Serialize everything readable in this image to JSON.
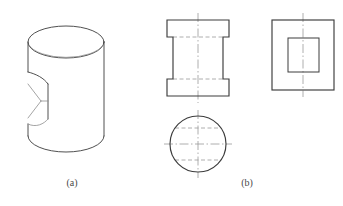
{
  "figure": {
    "kind": "engineering-orthographic-drawing",
    "background_color": "#ffffff",
    "line_color": "#3c3c3c",
    "hidden_line_color": "#9a9a9a",
    "center_line_color": "#9a9a9a",
    "captions": [
      {
        "id": "a",
        "label": "(a)",
        "x": 72,
        "y": 186
      },
      {
        "id": "b",
        "label": "(b)",
        "x": 247,
        "y": 186
      }
    ],
    "panel_a": {
      "name": "pictorial-cylinder-with-slot",
      "description": "Isometric cylinder with a rectangular slot cut into the front face",
      "cylinder": {
        "top_ellipse": {
          "cx": 66,
          "cy": 42,
          "rx": 38,
          "ry": 16
        },
        "bottom_ellipse": {
          "cx": 66,
          "cy": 136,
          "rx": 38,
          "ry": 16
        },
        "left_wall_x": 28,
        "right_wall_x": 104,
        "top_y": 42,
        "bottom_y": 136
      },
      "slot": {
        "top_y": 72,
        "bottom_y": 124,
        "front_face_x": 48,
        "left_x": 28,
        "depth_apex_x": 41,
        "depth_apex_y": 101
      }
    },
    "panel_b": {
      "name": "three-view-orthographic-projection",
      "views": [
        {
          "id": "front-view",
          "label": "front-view",
          "shape": "spool-profile",
          "outline": {
            "x": 167,
            "y": 20,
            "width": 62,
            "height": 76
          },
          "flange_height": 17,
          "web_inset": 6,
          "hidden_lines_y": [
            37,
            79
          ],
          "center_line_x": 198
        },
        {
          "id": "side-view",
          "label": "side-view",
          "shape": "rectangle-with-inner-rectangle",
          "outline": {
            "x": 272,
            "y": 20,
            "width": 62,
            "height": 70
          },
          "inner": {
            "x": 288,
            "y": 38,
            "width": 31,
            "height": 34
          },
          "center_line_x": 303
        },
        {
          "id": "top-view",
          "label": "top-view",
          "shape": "circle",
          "circle": {
            "cx": 198,
            "cy": 144,
            "r": 28
          },
          "hidden_lines_y": [
            128,
            160
          ],
          "center_line_x": 198,
          "center_line_y": 144
        }
      ]
    }
  }
}
